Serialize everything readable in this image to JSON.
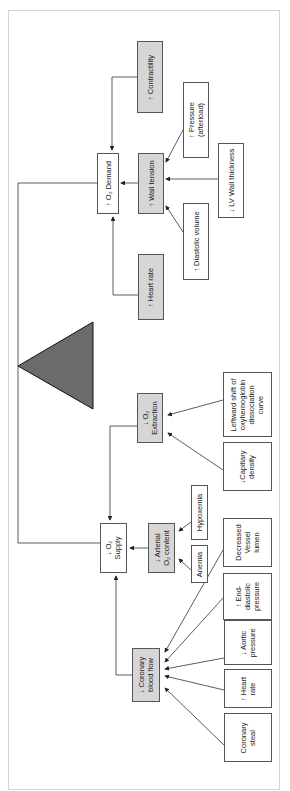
{
  "diagram": {
    "title": "",
    "orientation": "rotated-90",
    "colors": {
      "box_fill_gray": "#d6d6d6",
      "box_fill_white": "#ffffff",
      "triangle": "#6b6b6b",
      "line": "#333333"
    },
    "fulcrum": {
      "shape": "triangle",
      "name": "balance"
    },
    "demand_side": {
      "center": {
        "label": "↑ O₂ Demand"
      },
      "wall_tension": {
        "label": "↑ Wall tension"
      },
      "contractility": {
        "label": "↑ Contractility"
      },
      "heart_rate": {
        "label": "↑ Heart rate"
      },
      "pressure": {
        "line1": "↑ Pressure",
        "line2": "(afterload)"
      },
      "lv_wall": {
        "label": "↓ LV Wall thickness"
      },
      "diastolic_volume": {
        "label": "↑ Diastolic volume"
      }
    },
    "supply_side": {
      "center": {
        "line1": "↓ O₂",
        "line2": "Supply"
      },
      "extraction": {
        "line1": "↓ O₂",
        "line2": "Extraction"
      },
      "leftward_shift": {
        "line1": "Leftward shift of",
        "line2": "oxyhemoglobin",
        "line3": "dissociation",
        "line4": "curve"
      },
      "capillary": {
        "line1": "↓Capillary",
        "line2": "density"
      },
      "arterial": {
        "line1": "↓ Arterial",
        "line2": "O₂ content"
      },
      "hypoxemia": {
        "label": "Hypoxemia"
      },
      "anemia": {
        "label": "Anemia"
      },
      "coronary_flow": {
        "line1": "↓ Coronary",
        "line2": "blood flow"
      },
      "decreased_lumen": {
        "line1": "Decreased",
        "line2": "Vessel",
        "line3": "lumen"
      },
      "end_diastolic": {
        "line1": "↑ End-",
        "line2": "diastolic",
        "line3": "pressure"
      },
      "aortic": {
        "line1": "↓ Aortic",
        "line2": "pressure"
      },
      "heart_rate": {
        "line1": "↑ Heart",
        "line2": "rate"
      },
      "coronary_steal": {
        "line1": "Coronary",
        "line2": "steal"
      }
    }
  }
}
